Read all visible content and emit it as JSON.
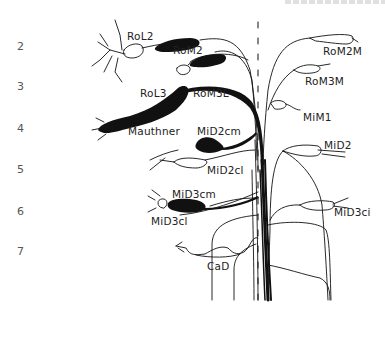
{
  "figure": {
    "type": "neuroanatomy-diagram",
    "segments": [
      "2",
      "3",
      "4",
      "5",
      "6",
      "7"
    ],
    "neurons_left": [
      {
        "label": "RoL2",
        "segment": "2"
      },
      {
        "label": "RoM2",
        "segment": "2"
      },
      {
        "label": "RoL3",
        "segment": "3"
      },
      {
        "label": "RoM3L",
        "segment": "3"
      },
      {
        "label": "Mauthner",
        "segment": "4"
      },
      {
        "label": "MiD2cm",
        "segment": "5"
      },
      {
        "label": "MiD2cl",
        "segment": "5"
      },
      {
        "label": "MiD3cm",
        "segment": "6"
      },
      {
        "label": "MiD3cl",
        "segment": "6"
      },
      {
        "label": "CaD",
        "segment": "7"
      }
    ],
    "neurons_right": [
      {
        "label": "RoM2M",
        "segment": "2"
      },
      {
        "label": "RoM3M",
        "segment": "3"
      },
      {
        "label": "MiM1",
        "segment": "4"
      },
      {
        "label": "MiD2",
        "segment": "5"
      },
      {
        "label": "MiD3ci",
        "segment": "6"
      }
    ],
    "colors": {
      "ink": "#111111",
      "background": "#ffffff",
      "row_numbers": "#555555"
    }
  }
}
